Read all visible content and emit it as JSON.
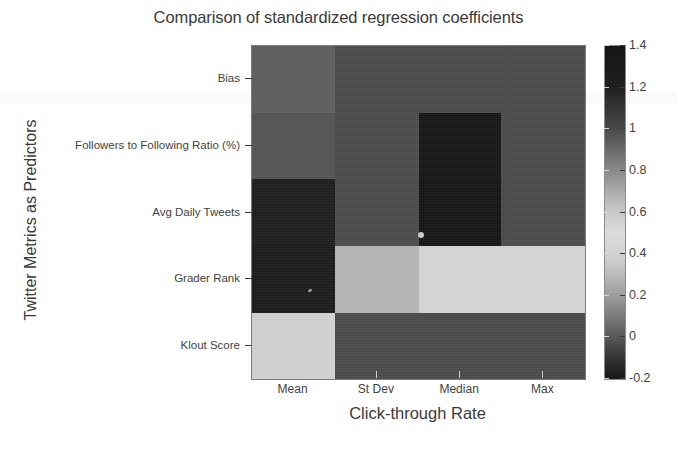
{
  "chart_data": {
    "type": "heatmap",
    "title": "Comparison of standardized regression coefficients",
    "xlabel": "Click-through Rate",
    "ylabel": "Twitter Metrics as Predictors",
    "x_categories": [
      "Mean",
      "St Dev",
      "Median",
      "Max"
    ],
    "y_categories": [
      "Bias",
      "Followers to Following Ratio (%)",
      "Avg Daily Tweets",
      "Grader Rank",
      "Klout Score"
    ],
    "colorbar": {
      "ticks": [
        "1.4",
        "1.2",
        "1",
        "0.8",
        "0.6",
        "0.4",
        "0.2",
        "0",
        "-0.2"
      ],
      "tick_values": [
        1.4,
        1.2,
        1.0,
        0.8,
        0.6,
        0.4,
        0.2,
        0.0,
        -0.2
      ],
      "vmin": -0.2,
      "vmax": 1.4,
      "colormap": "grayscale-cyclic-dark-light-dark",
      "position": "right"
    },
    "rows": [
      {
        "label": "Bias",
        "cells": [
          {
            "column": "Mean",
            "value": 0.32,
            "color": "#5e5e5e"
          },
          {
            "column": "St Dev",
            "value": 0.18,
            "color": "#4c4c4c"
          },
          {
            "column": "Median",
            "value": 0.18,
            "color": "#4c4c4c"
          },
          {
            "column": "Max",
            "value": 0.18,
            "color": "#4c4c4c"
          }
        ]
      },
      {
        "label": "Followers to Following Ratio (%)",
        "cells": [
          {
            "column": "Mean",
            "value": 0.24,
            "color": "#545454"
          },
          {
            "column": "St Dev",
            "value": 0.18,
            "color": "#4c4c4c"
          },
          {
            "column": "Median",
            "value": 1.38,
            "color": "#161616"
          },
          {
            "column": "Max",
            "value": 0.18,
            "color": "#4c4c4c"
          }
        ]
      },
      {
        "label": "Avg Daily Tweets",
        "cells": [
          {
            "column": "Mean",
            "value": 1.34,
            "color": "#1d1d1d"
          },
          {
            "column": "St Dev",
            "value": 0.18,
            "color": "#4c4c4c"
          },
          {
            "column": "Median",
            "value": 1.38,
            "color": "#151515"
          },
          {
            "column": "Max",
            "value": 0.18,
            "color": "#4c4c4c"
          }
        ]
      },
      {
        "label": "Grader Rank",
        "cells": [
          {
            "column": "Mean",
            "value": 1.36,
            "color": "#1b1b1b"
          },
          {
            "column": "St Dev",
            "value": 0.6,
            "color": "#b4b4b4"
          },
          {
            "column": "Median",
            "value": 0.7,
            "color": "#d6d6d6"
          },
          {
            "column": "Max",
            "value": 0.7,
            "color": "#d6d6d6"
          }
        ]
      },
      {
        "label": "Klout Score",
        "cells": [
          {
            "column": "Mean",
            "value": 0.68,
            "color": "#d2d2d2"
          },
          {
            "column": "St Dev",
            "value": 0.17,
            "color": "#4a4a4a"
          },
          {
            "column": "Median",
            "value": 0.17,
            "color": "#4a4a4a"
          },
          {
            "column": "Max",
            "value": 0.17,
            "color": "#4a4a4a"
          }
        ]
      }
    ]
  }
}
